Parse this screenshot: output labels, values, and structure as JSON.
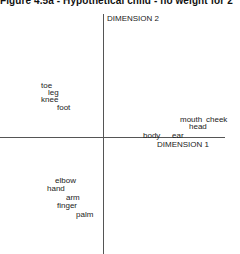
{
  "chart_data": {
    "type": "scatter",
    "title": "Figure 4.5a - Hypothetical child - no weight for 2",
    "xlabel": "DIMENSION 1",
    "ylabel": "DIMENSION 2",
    "grid": false,
    "legend": null,
    "axes": {
      "origin_px": {
        "x": 103,
        "y": 137
      }
    },
    "points": [
      {
        "label": "toe",
        "x": 41,
        "y": 81
      },
      {
        "label": "leg",
        "x": 48,
        "y": 88
      },
      {
        "label": "knee",
        "x": 41,
        "y": 95
      },
      {
        "label": "foot",
        "x": 57,
        "y": 103
      },
      {
        "label": "mouth",
        "x": 180,
        "y": 115
      },
      {
        "label": "cheek",
        "x": 206,
        "y": 115
      },
      {
        "label": "head",
        "x": 189,
        "y": 122
      },
      {
        "label": "body",
        "x": 143,
        "y": 131
      },
      {
        "label": "ear",
        "x": 172,
        "y": 131
      },
      {
        "label": "elbow",
        "x": 55,
        "y": 176
      },
      {
        "label": "hand",
        "x": 47,
        "y": 184
      },
      {
        "label": "arm",
        "x": 66,
        "y": 193
      },
      {
        "label": "finger",
        "x": 57,
        "y": 201
      },
      {
        "label": "palm",
        "x": 76,
        "y": 210
      }
    ]
  },
  "labels": {
    "title": "Figure 4.5a - Hypothetical child - no weight for 2",
    "dim1": "DIMENSION 1",
    "dim2": "DIMENSION 2"
  }
}
